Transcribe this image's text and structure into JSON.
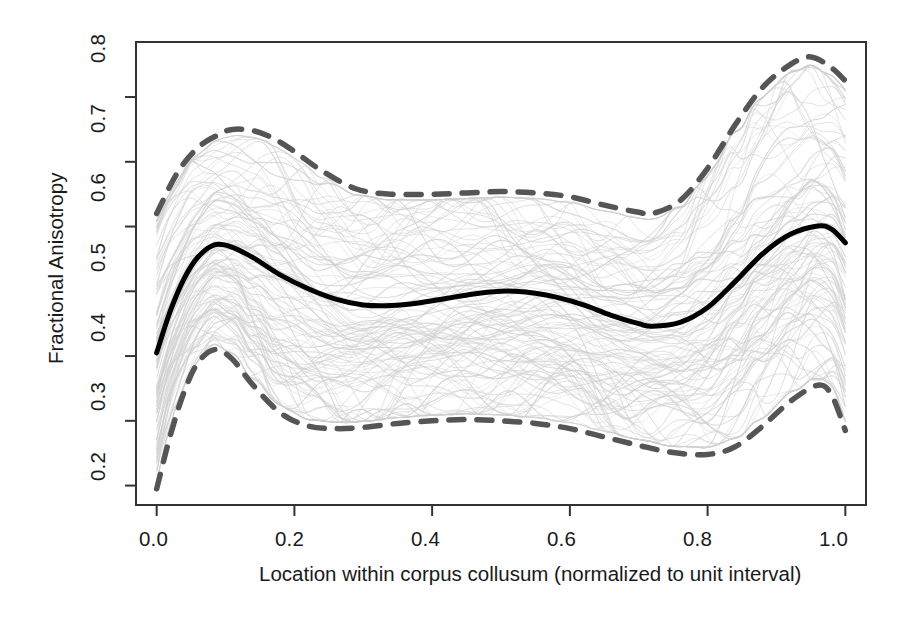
{
  "chart_data": {
    "type": "line",
    "title": "",
    "subtitle": "",
    "xlabel": "Location within corpus collusum (normalized to unit interval)",
    "ylabel": "Fractional Anisotropy",
    "xlim": [
      -0.03,
      1.03
    ],
    "ylim": [
      0.17,
      0.885
    ],
    "xticks": [
      0.0,
      0.2,
      0.4,
      0.6,
      0.8,
      1.0
    ],
    "xtick_labels": [
      "0.0",
      "0.2",
      "0.4",
      "0.6",
      "0.8",
      "1.0"
    ],
    "yticks": [
      0.2,
      0.3,
      0.4,
      0.5,
      0.6,
      0.7,
      0.8
    ],
    "ytick_labels": [
      "0.2",
      "0.3",
      "0.4",
      "0.5",
      "0.6",
      "0.7",
      "0.8"
    ],
    "grid": false,
    "legend": "none",
    "box": true,
    "colors": {
      "mean_curve": "#000000",
      "band_curve": "#555555",
      "spaghetti": "#cfcfcf",
      "axis": "#333333",
      "background": "#ffffff"
    },
    "series": [
      {
        "name": "Upper quantile band",
        "style": "dashed",
        "color": "#555555",
        "x": [
          0.0,
          0.03,
          0.06,
          0.09,
          0.11,
          0.14,
          0.17,
          0.2,
          0.24,
          0.29,
          0.34,
          0.4,
          0.45,
          0.5,
          0.55,
          0.6,
          0.65,
          0.7,
          0.72,
          0.76,
          0.8,
          0.84,
          0.88,
          0.92,
          0.95,
          0.98,
          1.0
        ],
        "y": [
          0.62,
          0.683,
          0.722,
          0.742,
          0.75,
          0.748,
          0.736,
          0.716,
          0.686,
          0.658,
          0.65,
          0.65,
          0.652,
          0.654,
          0.652,
          0.646,
          0.633,
          0.622,
          0.62,
          0.64,
          0.69,
          0.757,
          0.815,
          0.85,
          0.862,
          0.845,
          0.825
        ]
      },
      {
        "name": "Mean curve",
        "style": "solid",
        "color": "#000000",
        "x": [
          0.0,
          0.02,
          0.04,
          0.06,
          0.085,
          0.11,
          0.14,
          0.18,
          0.22,
          0.26,
          0.3,
          0.34,
          0.38,
          0.42,
          0.46,
          0.5,
          0.52,
          0.55,
          0.58,
          0.62,
          0.66,
          0.7,
          0.72,
          0.76,
          0.8,
          0.84,
          0.88,
          0.92,
          0.96,
          0.98,
          1.0
        ],
        "y": [
          0.405,
          0.47,
          0.52,
          0.553,
          0.572,
          0.568,
          0.552,
          0.525,
          0.504,
          0.488,
          0.479,
          0.478,
          0.482,
          0.489,
          0.496,
          0.5,
          0.5,
          0.497,
          0.491,
          0.479,
          0.463,
          0.45,
          0.446,
          0.452,
          0.475,
          0.515,
          0.558,
          0.588,
          0.601,
          0.596,
          0.575
        ]
      },
      {
        "name": "Lower quantile band",
        "style": "dashed",
        "color": "#555555",
        "x": [
          0.0,
          0.02,
          0.04,
          0.06,
          0.085,
          0.11,
          0.14,
          0.18,
          0.22,
          0.26,
          0.3,
          0.35,
          0.4,
          0.45,
          0.5,
          0.55,
          0.6,
          0.65,
          0.7,
          0.75,
          0.8,
          0.84,
          0.88,
          0.92,
          0.96,
          0.98,
          1.0
        ],
        "y": [
          0.195,
          0.278,
          0.345,
          0.39,
          0.41,
          0.395,
          0.355,
          0.312,
          0.292,
          0.288,
          0.29,
          0.296,
          0.3,
          0.302,
          0.3,
          0.296,
          0.288,
          0.275,
          0.262,
          0.251,
          0.248,
          0.26,
          0.292,
          0.33,
          0.355,
          0.34,
          0.285
        ]
      }
    ],
    "spaghetti": {
      "name": "Individual subject FA profiles",
      "count": 120,
      "color": "#cfcfcf",
      "description": "Light gray individual curves forming a dense band between the dashed quantile bounds"
    }
  },
  "geometry": {
    "plot_left": 136,
    "plot_right": 866,
    "plot_top": 42,
    "plot_bottom": 505
  }
}
